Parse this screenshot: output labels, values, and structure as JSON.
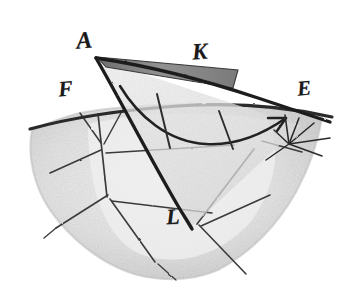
{
  "figure": {
    "domain": "diagram",
    "kind": "engraving-geometric-figure",
    "background_color": "#ffffff",
    "ink_color": "#262626",
    "surface_fill_color": "#e8e8e8",
    "surface_shadow_color": "#cfcfcf",
    "wedge_fill_color": "#8f8f8f",
    "cone_fill_color": "#e2e2e2",
    "width": 341,
    "height": 288
  },
  "labels": {
    "A": {
      "text": "A",
      "x": 96,
      "y": 58,
      "role": "cone-apex"
    },
    "K": {
      "text": "K",
      "x": 205,
      "y": 62,
      "role": "upper-wedge-point"
    },
    "F": {
      "text": "F",
      "x": 70,
      "y": 96,
      "role": "left-ridge-point"
    },
    "E": {
      "text": "E",
      "x": 308,
      "y": 95,
      "role": "right-burst-point"
    },
    "L": {
      "text": "L",
      "x": 178,
      "y": 222,
      "role": "cone-base-point"
    }
  },
  "geometry": {
    "cone": {
      "apex": [
        96,
        58
      ],
      "left_edge_end": [
        190,
        228
      ],
      "right_edge_end": [
        300,
        126
      ],
      "description": "narrow triangular cone from apex A widening toward the right and downward"
    },
    "wedge_band": {
      "points": [
        [
          97,
          57
        ],
        [
          236,
          70
        ],
        [
          232,
          86
        ],
        [
          104,
          66
        ]
      ],
      "description": "dark shaded band beneath the upper cone edge, near K"
    },
    "ridge_line": {
      "from": [
        30,
        128
      ],
      "to": [
        330,
        116
      ],
      "description": "terrain ridge crossing the figure from F on the left to E on the right"
    },
    "arc_inside_cone": {
      "start": [
        122,
        88
      ],
      "control": [
        200,
        152
      ],
      "end": [
        288,
        117
      ],
      "description": "curved line sweeping through the interior of the cone ending in an arrowhead near E"
    },
    "arrowhead": {
      "tip": [
        288,
        117
      ],
      "angle_deg": -28
    },
    "burst_center": [
      289,
      144
    ],
    "burst_ray_count": 7,
    "surface_outline": [
      [
        32,
        130
      ],
      [
        92,
        112
      ],
      [
        170,
        106
      ],
      [
        250,
        104
      ],
      [
        320,
        118
      ],
      [
        312,
        160
      ],
      [
        288,
        208
      ],
      [
        250,
        250
      ],
      [
        196,
        276
      ],
      [
        140,
        278
      ],
      [
        92,
        258
      ],
      [
        52,
        218
      ],
      [
        28,
        176
      ]
    ],
    "fracture_lines": [
      {
        "from": [
          98,
          116
        ],
        "to": [
          106,
          196
        ],
        "name": "crack-upper-left-vertical"
      },
      {
        "from": [
          82,
          114
        ],
        "to": [
          101,
          142
        ],
        "name": "crack-f-spur-a"
      },
      {
        "from": [
          120,
          112
        ],
        "to": [
          103,
          143
        ],
        "name": "crack-f-spur-b"
      },
      {
        "from": [
          102,
          148
        ],
        "to": [
          52,
          172
        ],
        "name": "crack-left-outward"
      },
      {
        "from": [
          106,
          152
        ],
        "to": [
          232,
          144
        ],
        "name": "crack-mid-horizontal"
      },
      {
        "from": [
          108,
          194
        ],
        "to": [
          58,
          226
        ],
        "name": "crack-lower-left"
      },
      {
        "from": [
          110,
          198
        ],
        "to": [
          152,
          258
        ],
        "name": "crack-lower-center-a"
      },
      {
        "from": [
          114,
          200
        ],
        "to": [
          210,
          212
        ],
        "name": "crack-lower-center-b"
      },
      {
        "from": [
          252,
          148
        ],
        "to": [
          196,
          224
        ],
        "name": "crack-right-diagonal"
      },
      {
        "from": [
          198,
          224
        ],
        "to": [
          244,
          272
        ],
        "name": "crack-lower-right-a"
      },
      {
        "from": [
          200,
          226
        ],
        "to": [
          268,
          196
        ],
        "name": "crack-lower-right-b"
      },
      {
        "from": [
          158,
          96
        ],
        "to": [
          168,
          146
        ],
        "name": "tick-mid-cone"
      },
      {
        "from": [
          218,
          112
        ],
        "to": [
          232,
          148
        ],
        "name": "tick-right-cone"
      },
      {
        "from": [
          262,
          140
        ],
        "to": [
          300,
          152
        ],
        "name": "crack-east-short"
      }
    ]
  }
}
